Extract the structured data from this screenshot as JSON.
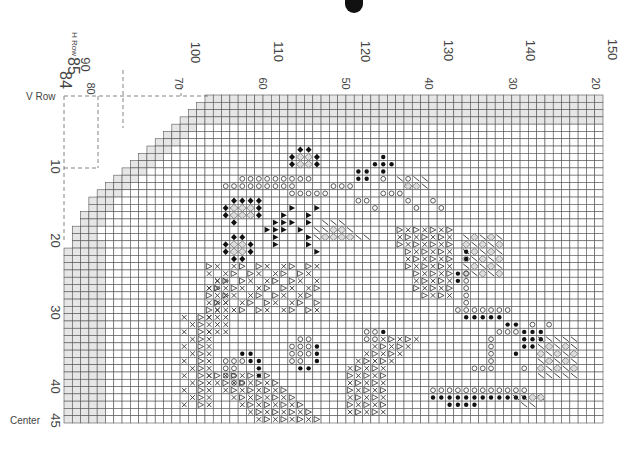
{
  "chart": {
    "title_mark": "black-tab",
    "grid": {
      "left": 64,
      "top": 95,
      "right": 603,
      "bottom": 423,
      "col_w": 8.35,
      "row_h": 7.3,
      "fill_shaded": "#e6e6e6",
      "line_color": "#555",
      "border_color": "#333"
    },
    "labels": {
      "h_row": "H Row",
      "v_row": "V Row",
      "center": "Center",
      "h_row_start": "85",
      "h_row_end": "84",
      "outer_cols": [
        "90",
        "100",
        "110",
        "120",
        "130",
        "140",
        "150"
      ],
      "inner_cols": [
        "80",
        "70",
        "60",
        "50",
        "40",
        "30",
        "20"
      ],
      "rows": [
        "10",
        "20",
        "30",
        "40",
        "45"
      ]
    },
    "symbols_legend": [
      {
        "key": "o",
        "name": "open-circle"
      },
      {
        "key": "d",
        "name": "filled-dot"
      },
      {
        "key": "x",
        "name": "cross"
      },
      {
        "key": "v",
        "name": "triangle-outline"
      },
      {
        "key": "t",
        "name": "filled-triangle"
      },
      {
        "key": "f",
        "name": "filled-diamond"
      },
      {
        "key": "s",
        "name": "slash"
      },
      {
        "key": "g",
        "name": "grey-diamond"
      }
    ]
  },
  "chart_data": {
    "type": "table",
    "xlabel": "H Row / stitch columns",
    "ylabel": "V Row",
    "x_outer_ticks": [
      90,
      100,
      110,
      120,
      130,
      140,
      150
    ],
    "x_inner_ticks": [
      80,
      70,
      60,
      50,
      40,
      30,
      20
    ],
    "y_ticks": [
      10,
      20,
      30,
      40,
      45
    ],
    "annotations": [
      "H Row 85 →",
      "← 84",
      "V Row",
      "Center → 45"
    ]
  }
}
